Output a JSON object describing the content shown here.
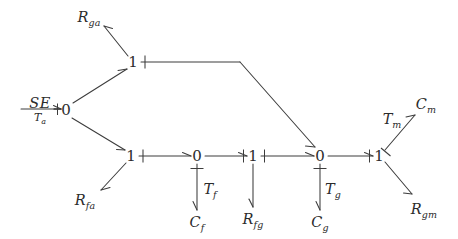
{
  "diagram": {
    "type": "bond-graph",
    "background_color": "#ffffff",
    "line_color": "#3c3c3c",
    "text_color": "#2b2b2b",
    "width": 458,
    "height": 239
  },
  "source": {
    "name": "effort-source",
    "symbol": "SE",
    "subject": "T",
    "subject_subscript": "a",
    "x": 40,
    "y": 109
  },
  "junctions": [
    {
      "id": "j0-left",
      "label": "0",
      "x": 66,
      "y": 110
    },
    {
      "id": "j1-top",
      "label": "1",
      "x": 133,
      "y": 62
    },
    {
      "id": "j1-lower",
      "label": "1",
      "x": 131,
      "y": 156
    },
    {
      "id": "j0-mid",
      "label": "0",
      "x": 197,
      "y": 156
    },
    {
      "id": "j1-mid",
      "label": "1",
      "x": 253,
      "y": 156
    },
    {
      "id": "j0-right",
      "label": "0",
      "x": 320,
      "y": 156
    },
    {
      "id": "j1-right",
      "label": "1",
      "x": 379,
      "y": 156
    }
  ],
  "elements": [
    {
      "id": "r-ga",
      "base": "R",
      "sub": "ga",
      "x": 89,
      "y": 17
    },
    {
      "id": "r-fa",
      "base": "R",
      "sub": "fa",
      "x": 85,
      "y": 200
    },
    {
      "id": "c-f",
      "base": "C",
      "sub": "f",
      "x": 197,
      "y": 222
    },
    {
      "id": "r-fg",
      "base": "R",
      "sub": "fg",
      "x": 253,
      "y": 219
    },
    {
      "id": "c-g",
      "base": "C",
      "sub": "g",
      "x": 320,
      "y": 222
    },
    {
      "id": "c-m",
      "base": "C",
      "sub": "m",
      "x": 426,
      "y": 104
    },
    {
      "id": "r-gm",
      "base": "R",
      "sub": "gm",
      "x": 424,
      "y": 209
    }
  ],
  "bond_labels": [
    {
      "id": "t-f",
      "base": "T",
      "sub": "f",
      "x": 210,
      "y": 189
    },
    {
      "id": "t-g",
      "base": "T",
      "sub": "g",
      "x": 333,
      "y": 189
    },
    {
      "id": "t-m",
      "base": "T",
      "sub": "m",
      "x": 392,
      "y": 119
    }
  ],
  "bonds": [
    {
      "id": "se-to-j0left",
      "from": "effort-source",
      "to": "j0-left",
      "causality": "at-destination"
    },
    {
      "id": "j0left-to-j1top",
      "from": "j0-left",
      "to": "j1-top",
      "causality": "none"
    },
    {
      "id": "j0left-to-j1lower",
      "from": "j0-left",
      "to": "j1-lower",
      "causality": "none"
    },
    {
      "id": "j1top-to-rga",
      "from": "j1-top",
      "to": "r-ga",
      "causality": "none"
    },
    {
      "id": "j1top-to-j0right",
      "from": "j1-top",
      "to": "j0-right",
      "causality": "at-source"
    },
    {
      "id": "j1lower-to-rfa",
      "from": "j1-lower",
      "to": "r-fa",
      "causality": "none"
    },
    {
      "id": "j1lower-to-j0mid",
      "from": "j1-lower",
      "to": "j0-mid",
      "causality": "at-source"
    },
    {
      "id": "j0mid-to-cf",
      "from": "j0-mid",
      "to": "c-f",
      "causality": "at-source"
    },
    {
      "id": "j0mid-to-j1mid",
      "from": "j0-mid",
      "to": "j1-mid",
      "causality": "at-destination"
    },
    {
      "id": "j1mid-to-rfg",
      "from": "j1-mid",
      "to": "r-fg",
      "causality": "none"
    },
    {
      "id": "j1mid-to-j0right",
      "from": "j1-mid",
      "to": "j0-right",
      "causality": "at-source"
    },
    {
      "id": "j0right-to-cg",
      "from": "j0-right",
      "to": "c-g",
      "causality": "at-source"
    },
    {
      "id": "j0right-to-j1right",
      "from": "j0-right",
      "to": "j1-right",
      "causality": "at-destination"
    },
    {
      "id": "j1right-to-cm",
      "from": "j1-right",
      "to": "c-m",
      "causality": "at-source"
    },
    {
      "id": "j1right-to-rgm",
      "from": "j1-right",
      "to": "r-gm",
      "causality": "none"
    }
  ]
}
